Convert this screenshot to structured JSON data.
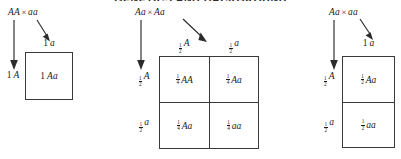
{
  "figure": {
    "page_title": "GENETICS AND BACKGROUND",
    "panels": [
      {
        "id": "panel-1",
        "cross": {
          "parent1": "AA",
          "operator": "×",
          "parent2": "aa"
        },
        "column_headers": [
          {
            "num": "1",
            "den": "",
            "whole": "1",
            "allele": "a"
          }
        ],
        "row_headers": [
          {
            "num": "1",
            "den": "",
            "whole": "1",
            "allele": "A"
          }
        ],
        "cells": [
          [
            {
              "num": "1",
              "den": "",
              "whole": "1",
              "genotype": "Aa"
            }
          ]
        ]
      },
      {
        "id": "panel-2",
        "cross": {
          "parent1": "Aa",
          "operator": "×",
          "parent2": "Aa"
        },
        "column_headers": [
          {
            "num": "1",
            "den": "2",
            "whole": "",
            "allele": "A"
          },
          {
            "num": "1",
            "den": "2",
            "whole": "",
            "allele": "a"
          }
        ],
        "row_headers": [
          {
            "num": "1",
            "den": "2",
            "whole": "",
            "allele": "A"
          },
          {
            "num": "1",
            "den": "2",
            "whole": "",
            "allele": "a"
          }
        ],
        "cells": [
          [
            {
              "num": "1",
              "den": "4",
              "whole": "",
              "genotype": "AA"
            },
            {
              "num": "1",
              "den": "4",
              "whole": "",
              "genotype": "Aa"
            }
          ],
          [
            {
              "num": "1",
              "den": "4",
              "whole": "",
              "genotype": "Aa"
            },
            {
              "num": "1",
              "den": "4",
              "whole": "",
              "genotype": "aa"
            }
          ]
        ]
      },
      {
        "id": "panel-3",
        "cross": {
          "parent1": "Aa",
          "operator": "×",
          "parent2": "aa"
        },
        "column_headers": [
          {
            "num": "1",
            "den": "",
            "whole": "1",
            "allele": "a"
          }
        ],
        "row_headers": [
          {
            "num": "1",
            "den": "2",
            "whole": "",
            "allele": "A"
          },
          {
            "num": "1",
            "den": "2",
            "whole": "",
            "allele": "a"
          }
        ],
        "cells": [
          [
            {
              "num": "1",
              "den": "2",
              "whole": "",
              "genotype": "Aa"
            }
          ],
          [
            {
              "num": "1",
              "den": "2",
              "whole": "",
              "genotype": "aa"
            }
          ]
        ]
      }
    ]
  }
}
